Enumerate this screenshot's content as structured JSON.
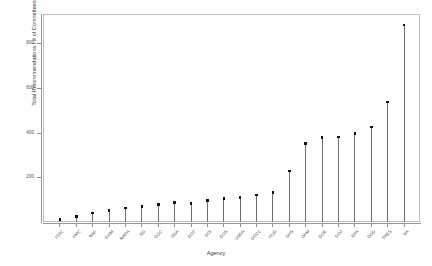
{
  "chart_data": {
    "type": "bar",
    "subtype": "lollipop",
    "title": "",
    "xlabel": "Agency",
    "ylabel": "Total Recommendations / # of Committees",
    "categories": [
      "FDIC",
      "FMC",
      "NSF",
      "EXIM",
      "NARA",
      "ED",
      "DOC",
      "GSA",
      "DOT",
      "DOI",
      "DOS",
      "USDA",
      "DOC2",
      "HUD",
      "DHS",
      "OPM",
      "DOE",
      "DOJ",
      "EPA",
      "DOD",
      "TRES",
      "VA"
    ],
    "values": [
      12,
      25,
      40,
      52,
      62,
      70,
      78,
      88,
      84,
      96,
      104,
      110,
      120,
      132,
      228,
      352,
      378,
      380,
      396,
      424,
      536,
      880
    ],
    "ylim": [
      0,
      930
    ],
    "yticks": [
      200,
      400,
      600,
      800
    ],
    "ytick_labels": [
      "200",
      "400",
      "600",
      "800"
    ],
    "grid": false,
    "legend": null,
    "point_color": "#111111",
    "stem_color": "#6f6f6f",
    "panel_border_color": "#bdbdbd",
    "axis_color": "#9a9a9a"
  }
}
